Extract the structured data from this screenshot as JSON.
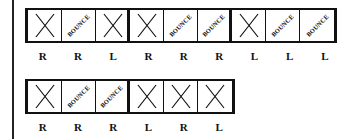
{
  "rows": [
    {
      "cells": [
        {
          "type": "X",
          "text": ""
        },
        {
          "type": "BOUNCE",
          "text": "BOUNCE"
        },
        {
          "type": "X",
          "text": ""
        },
        {
          "type": "X",
          "text": ""
        },
        {
          "type": "BOUNCE",
          "text": "BOUNCE"
        },
        {
          "type": "BOUNCE",
          "text": "BOUNCE"
        },
        {
          "type": "X",
          "text": ""
        },
        {
          "type": "BOUNCE",
          "text": "BOUNCE"
        },
        {
          "type": "BOUNCE",
          "text": "BOUNCE"
        }
      ],
      "labels": [
        "R",
        "R",
        "L",
        "R",
        "R",
        "R",
        "L",
        "L",
        "L"
      ]
    },
    {
      "cells": [
        {
          "type": "X",
          "text": ""
        },
        {
          "type": "BOUNCE",
          "text": "BOUNCE"
        },
        {
          "type": "BOUNCE",
          "text": "BOUNCE"
        },
        {
          "type": "X",
          "text": ""
        },
        {
          "type": "X",
          "text": ""
        },
        {
          "type": "X",
          "text": ""
        }
      ],
      "labels": [
        "R",
        "R",
        "R",
        "L",
        "R",
        "L"
      ]
    }
  ]
}
